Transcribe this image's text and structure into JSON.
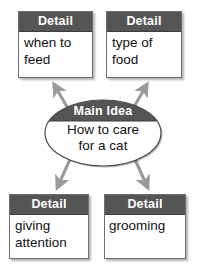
{
  "diagram": {
    "type": "main-idea-web",
    "colors": {
      "header_fill": "#555555",
      "box_fill": "#ffffff",
      "box_border": "#6e6e6e",
      "arrow": "#9a9a9a",
      "ellipse_top_fill": "#555555",
      "ellipse_bottom_fill": "#ffffff",
      "header_text": "#ffffff",
      "body_text": "#111111"
    },
    "center": {
      "label": "Main Idea",
      "text_line1": "How to care",
      "text_line2": "for a cat"
    },
    "details": [
      {
        "position": "top-left",
        "header": "Detail",
        "line1": "when to",
        "line2": "feed"
      },
      {
        "position": "top-right",
        "header": "Detail",
        "line1": "type of",
        "line2": "food"
      },
      {
        "position": "bottom-left",
        "header": "Detail",
        "line1": "giving",
        "line2": "attention"
      },
      {
        "position": "bottom-right",
        "header": "Detail",
        "line1": "grooming",
        "line2": ""
      }
    ],
    "arrows": [
      {
        "name": "arrow-to-top-left",
        "direction": "up-left"
      },
      {
        "name": "arrow-to-top-right",
        "direction": "up-right"
      },
      {
        "name": "arrow-to-bottom-left",
        "direction": "down-left"
      },
      {
        "name": "arrow-to-bottom-right",
        "direction": "down-right"
      }
    ]
  }
}
